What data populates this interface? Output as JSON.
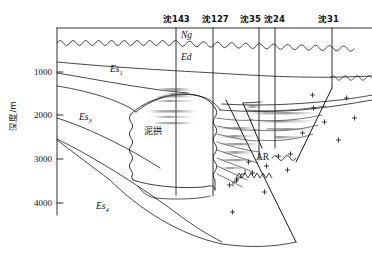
{
  "figure": {
    "kind": "geological-cross-section",
    "background_color": "#ffffff",
    "line_color": "#1a1a1a",
    "shading_color": "#8c8c8c"
  },
  "depth_axis": {
    "title": "深度/m",
    "unit": "m",
    "ticks": [
      "1000",
      "2000",
      "3000",
      "4000"
    ],
    "tick_values": [
      1000,
      2000,
      3000,
      4000
    ]
  },
  "wells": [
    {
      "name": "沈143",
      "label_x": 176,
      "line_x": 176
    },
    {
      "name": "沈127",
      "label_x": 213,
      "line_x": 213
    },
    {
      "name": "沈35",
      "label_x": 250,
      "line_x": 259
    },
    {
      "name": "沈24",
      "label_x": 272,
      "line_x": 275
    },
    {
      "name": "沈31",
      "label_x": 325,
      "line_x": 332
    }
  ],
  "formations": [
    {
      "code": "Ng",
      "sub": "",
      "x": 181,
      "y": 36
    },
    {
      "code": "Ed",
      "sub": "",
      "x": 181,
      "y": 58
    },
    {
      "code": "Es",
      "sub": "1",
      "x": 113,
      "y": 70
    },
    {
      "code": "Es",
      "sub": "3",
      "x": 82,
      "y": 118
    },
    {
      "code": "Es",
      "sub": "4",
      "x": 98,
      "y": 207
    }
  ],
  "annotations": [
    {
      "text": "泥拱",
      "x": 148,
      "y": 132,
      "style": "cjk"
    },
    {
      "text": "AR",
      "x": 260,
      "y": 158,
      "style": "basement"
    }
  ]
}
